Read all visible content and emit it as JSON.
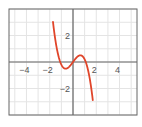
{
  "chart_data": {
    "type": "line",
    "title": "",
    "xlabel": "",
    "ylabel": "",
    "xlim": [
      -5.5,
      5.5
    ],
    "ylim": [
      -4,
      4
    ],
    "grid": true,
    "grid_step": 1,
    "x_ticks": [
      {
        "value": -4,
        "label": "−4"
      },
      {
        "value": -2,
        "label": "−2"
      },
      {
        "value": 2,
        "label": "2"
      },
      {
        "value": 4,
        "label": "4"
      }
    ],
    "y_ticks": [
      {
        "value": 2,
        "label": "2"
      },
      {
        "value": -2,
        "label": "−2"
      }
    ],
    "series": [
      {
        "name": "cubic",
        "color": "#e0452a",
        "function": "y = -(x^3 - 1.2x)",
        "x": [
          -1.7,
          -1.5,
          -1.25,
          -1.0,
          -0.8,
          -0.63,
          -0.4,
          -0.2,
          0,
          0.2,
          0.4,
          0.63,
          0.8,
          1.0,
          1.25,
          1.5,
          1.7
        ],
        "y": [
          3.87,
          1.58,
          0.45,
          -0.2,
          -0.45,
          -0.5,
          -0.42,
          -0.23,
          0,
          0.23,
          0.42,
          0.5,
          0.45,
          0.2,
          -0.45,
          -1.58,
          -3.87
        ]
      }
    ]
  },
  "colors": {
    "frame": "#666666",
    "grid": "#e4e4e4",
    "axis": "#666666",
    "curve": "#e0452a"
  }
}
